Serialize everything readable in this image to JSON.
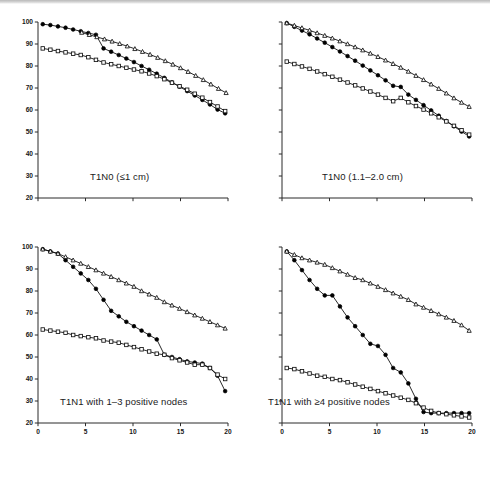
{
  "figure": {
    "name": "four-panel-survival-figure",
    "background": "#ffffff",
    "accent": "#000000"
  },
  "axis": {
    "y_ticks": [
      20,
      30,
      40,
      50,
      60,
      70,
      80,
      90,
      100
    ],
    "y_tick_labels": [
      "20",
      "30",
      "40",
      "50",
      "60",
      "70",
      "80",
      "90",
      "100"
    ],
    "x_ticks": [
      0,
      5,
      10,
      15,
      20
    ],
    "x_tick_labels": [
      "0",
      "5",
      "10",
      "15",
      "20"
    ],
    "ylim": [
      20,
      100
    ],
    "xlim": [
      0,
      20
    ]
  },
  "panels": [
    {
      "id": "top-left",
      "title": "T1N0 (≤1 cm)"
    },
    {
      "id": "top-right",
      "title": "T1N0 (1.1–2.0 cm)"
    },
    {
      "id": "bottom-left",
      "title": "T1N1 with 1–3 positive nodes"
    },
    {
      "id": "bottom-right",
      "title": "T1N1 with ≥4 positive nodes"
    }
  ],
  "chart_data": [
    {
      "type": "line",
      "title": "T1N0 (≤1 cm)",
      "xlabel": "",
      "ylabel": "",
      "xlim": [
        0,
        20
      ],
      "ylim": [
        20,
        100
      ],
      "grid": false,
      "legend": "none",
      "x_ticks": [
        0,
        5,
        10,
        15,
        20
      ],
      "y_ticks": [
        20,
        30,
        40,
        50,
        60,
        70,
        80,
        90,
        100
      ],
      "x_tick_labels_shown": false,
      "y_tick_labels_shown": true,
      "series": [
        {
          "name": "filled-circle-series",
          "marker": "filled-circle",
          "x": [
            0.5,
            1.3,
            2.1,
            2.9,
            3.7,
            4.5,
            5.3,
            6.1,
            6.9,
            7.7,
            8.5,
            9.3,
            10.1,
            10.9,
            11.7,
            12.5,
            13.3,
            14.1,
            14.9,
            15.7,
            16.5,
            17.3,
            18.1,
            18.9,
            19.7
          ],
          "y": [
            99,
            98.6,
            98,
            97.4,
            96.6,
            95.8,
            95,
            94.2,
            88,
            86.5,
            85,
            83.4,
            81.8,
            80,
            78.3,
            76.5,
            74.6,
            72.6,
            70.6,
            68.6,
            66.6,
            64.6,
            62.5,
            60.2,
            58.5
          ]
        },
        {
          "name": "open-triangle-series",
          "marker": "open-triangle",
          "x": [
            4.6,
            5.4,
            6.2,
            7.0,
            7.8,
            8.6,
            9.4,
            10.2,
            11.0,
            11.8,
            12.6,
            13.4,
            14.2,
            15.0,
            15.8,
            16.6,
            17.4,
            18.2,
            19.0,
            19.8
          ],
          "y": [
            95.2,
            94.2,
            93.2,
            92.2,
            91.2,
            90.1,
            89.0,
            87.8,
            86.5,
            85.2,
            83.8,
            82.3,
            80.7,
            79.1,
            77.4,
            75.6,
            73.7,
            71.7,
            69.7,
            67.8
          ]
        },
        {
          "name": "open-square-series",
          "marker": "open-square",
          "x": [
            0.5,
            1.3,
            2.1,
            2.9,
            3.7,
            4.5,
            5.3,
            6.1,
            6.9,
            7.7,
            8.5,
            9.3,
            10.1,
            10.9,
            11.7,
            12.5,
            13.3,
            14.1,
            14.9,
            15.7,
            16.5,
            17.3,
            18.1,
            18.9,
            19.7
          ],
          "y": [
            88,
            87.4,
            86.8,
            86.2,
            85.6,
            85,
            84,
            82.8,
            81.6,
            80.8,
            80,
            79.2,
            78.4,
            77.6,
            76.6,
            75.4,
            74,
            72.4,
            70.8,
            69.2,
            67.4,
            65.6,
            63.6,
            61.6,
            59.5
          ]
        }
      ]
    },
    {
      "type": "line",
      "title": "T1N0 (1.1–2.0 cm)",
      "xlabel": "",
      "ylabel": "",
      "xlim": [
        0,
        20
      ],
      "ylim": [
        20,
        100
      ],
      "grid": false,
      "legend": "none",
      "x_ticks": [
        0,
        5,
        10,
        15,
        20
      ],
      "y_ticks": [
        20,
        30,
        40,
        50,
        60,
        70,
        80,
        90,
        100
      ],
      "x_tick_labels_shown": false,
      "y_tick_labels_shown": false,
      "series": [
        {
          "name": "filled-circle-series",
          "marker": "filled-circle",
          "x": [
            0.5,
            1.3,
            2.1,
            2.9,
            3.7,
            4.5,
            5.3,
            6.1,
            6.9,
            7.7,
            8.5,
            9.3,
            10.1,
            10.9,
            11.7,
            12.5,
            13.3,
            14.1,
            14.9,
            15.7,
            16.5,
            17.3,
            18.1,
            18.9,
            19.7
          ],
          "y": [
            99.5,
            97.8,
            96.1,
            94.4,
            92.5,
            90.6,
            88.6,
            86.6,
            84.5,
            82.4,
            80.2,
            78.0,
            75.8,
            73.5,
            71.0,
            70.5,
            67.0,
            64.6,
            62.2,
            59.8,
            57.4,
            55.0,
            52.6,
            50.2,
            48.0
          ]
        },
        {
          "name": "open-triangle-series",
          "marker": "open-triangle",
          "x": [
            0.5,
            1.3,
            2.1,
            2.9,
            3.7,
            4.5,
            5.3,
            6.1,
            6.9,
            7.7,
            8.5,
            9.3,
            10.1,
            10.9,
            11.7,
            12.5,
            13.3,
            14.1,
            14.9,
            15.7,
            16.5,
            17.3,
            18.1,
            18.9,
            19.7
          ],
          "y": [
            99.5,
            98.4,
            97.3,
            96.2,
            95.0,
            93.8,
            92.6,
            91.3,
            90.0,
            88.6,
            87.2,
            85.7,
            84.2,
            82.6,
            81.0,
            79.3,
            77.5,
            75.6,
            73.7,
            71.7,
            69.7,
            67.6,
            65.4,
            63.4,
            61.5
          ]
        },
        {
          "name": "open-square-series",
          "marker": "open-square",
          "x": [
            0.5,
            1.3,
            2.1,
            2.9,
            3.7,
            4.5,
            5.3,
            6.1,
            6.9,
            7.7,
            8.5,
            9.3,
            10.1,
            10.9,
            11.7,
            12.5,
            13.3,
            14.1,
            14.9,
            15.7,
            16.5,
            17.3,
            18.1,
            18.9,
            19.7
          ],
          "y": [
            82,
            80.9,
            79.8,
            78.7,
            77.5,
            76.3,
            75.1,
            73.8,
            72.5,
            71.2,
            69.8,
            68.4,
            67.0,
            65.5,
            64.0,
            65.5,
            63.5,
            61.8,
            60.2,
            58.5,
            56.7,
            54.8,
            52.8,
            50.8,
            48.8
          ]
        }
      ]
    },
    {
      "type": "line",
      "title": "T1N1 with 1–3 positive nodes",
      "xlabel": "",
      "ylabel": "",
      "xlim": [
        0,
        20
      ],
      "ylim": [
        20,
        100
      ],
      "grid": false,
      "legend": "none",
      "x_ticks": [
        0,
        5,
        10,
        15,
        20
      ],
      "y_ticks": [
        20,
        30,
        40,
        50,
        60,
        70,
        80,
        90,
        100
      ],
      "x_tick_labels_shown": true,
      "y_tick_labels_shown": true,
      "series": [
        {
          "name": "filled-circle-series",
          "marker": "filled-circle",
          "x": [
            0.5,
            1.3,
            2.1,
            2.9,
            3.7,
            4.5,
            5.3,
            6.1,
            6.9,
            7.7,
            8.5,
            9.3,
            10.1,
            10.9,
            11.7,
            12.5,
            13.3,
            14.1,
            14.9,
            15.7,
            16.5,
            17.3,
            18.1,
            18.9,
            19.7
          ],
          "y": [
            99,
            98,
            97,
            94,
            91,
            88,
            85,
            81,
            76,
            71,
            68.5,
            66,
            64,
            62,
            60,
            58,
            51,
            50,
            49,
            48,
            47.5,
            47,
            45,
            41.5,
            34.5
          ]
        },
        {
          "name": "open-triangle-series",
          "marker": "open-triangle",
          "x": [
            0.5,
            1.3,
            2.1,
            2.9,
            3.7,
            4.5,
            5.3,
            6.1,
            6.9,
            7.7,
            8.5,
            9.3,
            10.1,
            10.9,
            11.7,
            12.5,
            13.3,
            14.1,
            14.9,
            15.7,
            16.5,
            17.3,
            18.1,
            18.9,
            19.7
          ],
          "y": [
            99,
            98,
            97,
            95.5,
            94,
            92.5,
            91,
            89.5,
            88,
            86.5,
            85,
            83.5,
            82,
            80,
            78.5,
            77,
            75,
            73.5,
            72,
            70.5,
            69,
            67.5,
            66,
            64.5,
            63
          ]
        },
        {
          "name": "open-square-series",
          "marker": "open-square",
          "x": [
            0.5,
            1.3,
            2.1,
            2.9,
            3.7,
            4.5,
            5.3,
            6.1,
            6.9,
            7.7,
            8.5,
            9.3,
            10.1,
            10.9,
            11.7,
            12.5,
            13.3,
            14.1,
            14.9,
            15.7,
            16.5,
            17.3,
            18.1,
            18.9,
            19.7
          ],
          "y": [
            62.5,
            62,
            61.5,
            61,
            60,
            59.5,
            59,
            58.5,
            57.5,
            57,
            56.5,
            55.5,
            54.5,
            53.5,
            52.5,
            51.5,
            51,
            49.5,
            48.5,
            47.5,
            46.5,
            46.5,
            45,
            42,
            40
          ]
        }
      ]
    },
    {
      "type": "line",
      "title": "T1N1 with ≥4 positive nodes",
      "xlabel": "",
      "ylabel": "",
      "xlim": [
        0,
        20
      ],
      "ylim": [
        20,
        100
      ],
      "grid": false,
      "legend": "none",
      "x_ticks": [
        0,
        5,
        10,
        15,
        20
      ],
      "y_ticks": [
        20,
        30,
        40,
        50,
        60,
        70,
        80,
        90,
        100
      ],
      "x_tick_labels_shown": true,
      "y_tick_labels_shown": false,
      "series": [
        {
          "name": "filled-circle-series",
          "marker": "filled-circle",
          "x": [
            0.5,
            1.3,
            2.1,
            2.9,
            3.7,
            4.5,
            5.3,
            6.1,
            6.9,
            7.7,
            8.5,
            9.3,
            10.1,
            10.9,
            11.7,
            12.5,
            13.3,
            14.1,
            14.9,
            15.7,
            16.5,
            17.3,
            18.1,
            18.9,
            19.7
          ],
          "y": [
            98,
            94,
            89.5,
            85,
            81,
            78,
            78,
            73,
            68,
            64,
            60,
            56,
            55,
            51,
            45,
            43,
            38,
            31,
            25,
            24.5,
            24.5,
            24.5,
            24.5,
            24.5,
            24.5
          ]
        },
        {
          "name": "open-triangle-series",
          "marker": "open-triangle",
          "x": [
            0.5,
            1.3,
            2.1,
            2.9,
            3.7,
            4.5,
            5.3,
            6.1,
            6.9,
            7.7,
            8.5,
            9.3,
            10.1,
            10.9,
            11.7,
            12.5,
            13.3,
            14.1,
            14.9,
            15.7,
            16.5,
            17.3,
            18.1,
            18.9,
            19.7
          ],
          "y": [
            98,
            96.5,
            95,
            94,
            93,
            92,
            90.5,
            89,
            87.5,
            86,
            85,
            83.5,
            82,
            80.5,
            79,
            77.5,
            76,
            74,
            72.5,
            71,
            69.5,
            68,
            66.5,
            64.5,
            62
          ]
        },
        {
          "name": "open-square-series",
          "marker": "open-square",
          "x": [
            0.5,
            1.3,
            2.1,
            2.9,
            3.7,
            4.5,
            5.3,
            6.1,
            6.9,
            7.7,
            8.5,
            9.3,
            10.1,
            10.9,
            11.7,
            12.5,
            13.3,
            14.1,
            14.9,
            15.7,
            16.5,
            17.3,
            18.1,
            18.9,
            19.7
          ],
          "y": [
            45,
            44.5,
            43.5,
            42.5,
            41.5,
            41,
            40,
            39.5,
            38.5,
            37.5,
            36.5,
            35.5,
            34.5,
            33.5,
            32.5,
            31.5,
            30.5,
            29,
            27,
            25.5,
            24.5,
            24,
            23.5,
            23,
            22.5
          ]
        }
      ]
    }
  ]
}
